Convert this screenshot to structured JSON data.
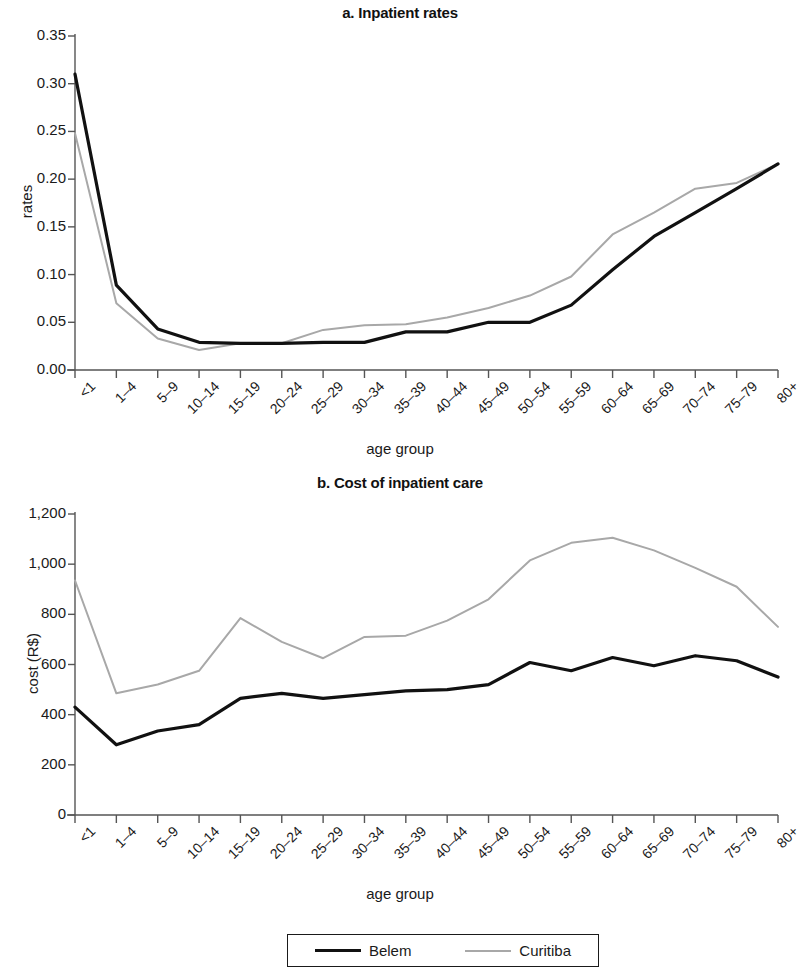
{
  "figure": {
    "xlabel": "age group",
    "legend": {
      "items": [
        {
          "label": "Belem",
          "color": "#111111",
          "icon": "line-swatch-black"
        },
        {
          "label": "Curitiba",
          "color": "#a8a8a8",
          "icon": "line-swatch-gray"
        }
      ]
    }
  },
  "chart_data": [
    {
      "type": "line",
      "panel": "a",
      "title": "a. Inpatient rates",
      "xlabel": "age group",
      "ylabel": "rates",
      "categories": [
        "<1",
        "1–4",
        "5–9",
        "10–14",
        "15–19",
        "20–24",
        "25–29",
        "30–34",
        "35–39",
        "40–44",
        "45–49",
        "50–54",
        "55–59",
        "60–64",
        "65–69",
        "70–74",
        "75–79",
        "80+"
      ],
      "yticks": [
        "0.00",
        "0.05",
        "0.10",
        "0.15",
        "0.20",
        "0.25",
        "0.30",
        "0.35"
      ],
      "ytick_values": [
        0.0,
        0.05,
        0.1,
        0.15,
        0.2,
        0.25,
        0.3,
        0.35
      ],
      "ylim": [
        0,
        0.35
      ],
      "grid": false,
      "legend_position": "bottom",
      "series": [
        {
          "name": "Belem",
          "color": "#111111",
          "width": 3.2,
          "values": [
            0.31,
            0.089,
            0.043,
            0.029,
            0.028,
            0.028,
            0.029,
            0.029,
            0.04,
            0.04,
            0.05,
            0.05,
            0.068,
            0.105,
            0.14,
            0.165,
            0.19,
            0.216
          ]
        },
        {
          "name": "Curitiba",
          "color": "#a8a8a8",
          "width": 2.0,
          "values": [
            0.248,
            0.07,
            0.033,
            0.021,
            0.028,
            0.028,
            0.042,
            0.047,
            0.048,
            0.055,
            0.065,
            0.078,
            0.098,
            0.142,
            0.165,
            0.19,
            0.196,
            0.216
          ]
        }
      ]
    },
    {
      "type": "line",
      "panel": "b",
      "title": "b. Cost of inpatient care",
      "xlabel": "age group",
      "ylabel": "cost (R$)",
      "categories": [
        "<1",
        "1–4",
        "5–9",
        "10–14",
        "15–19",
        "20–24",
        "25–29",
        "30–34",
        "35–39",
        "40–44",
        "45–49",
        "50–54",
        "55–59",
        "60–64",
        "65–69",
        "70–74",
        "75–79",
        "80+"
      ],
      "yticks": [
        "0",
        "200",
        "400",
        "600",
        "800",
        "1,000",
        "1,200"
      ],
      "ytick_values": [
        0,
        200,
        400,
        600,
        800,
        1000,
        1200
      ],
      "ylim": [
        0,
        1200
      ],
      "grid": false,
      "legend_position": "bottom",
      "series": [
        {
          "name": "Belem",
          "color": "#111111",
          "width": 3.2,
          "values": [
            430,
            280,
            335,
            360,
            465,
            485,
            465,
            480,
            495,
            500,
            520,
            608,
            575,
            628,
            595,
            635,
            615,
            550
          ]
        },
        {
          "name": "Curitiba",
          "color": "#a8a8a8",
          "width": 2.0,
          "values": [
            935,
            485,
            520,
            575,
            785,
            690,
            625,
            710,
            715,
            775,
            860,
            1015,
            1085,
            1105,
            1055,
            985,
            910,
            750
          ]
        }
      ]
    }
  ]
}
